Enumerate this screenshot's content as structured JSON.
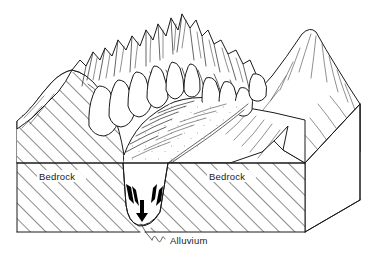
{
  "figure": {
    "type": "geological-block-diagram",
    "background_color": "#ffffff",
    "line_color": "#1a1a1a"
  },
  "labels": {
    "bedrock_left": "Bedrock",
    "bedrock_right": "Bedrock",
    "alluvium": "Alluvium"
  },
  "legend_patterns": {
    "bedrock_pattern": "diagonal-hatch",
    "alluvium_pattern": "horizontal-dash-stipple",
    "talus_pattern": "stipple-dots"
  },
  "features": [
    {
      "name": "arete-peaks",
      "label": "",
      "description": "serrated ridge crest with horn peaks"
    },
    {
      "name": "talus-cones",
      "label": "",
      "description": "stippled debris cones below cliffs"
    },
    {
      "name": "u-shaped-valley",
      "label": "",
      "description": "glacially carved valley cross-section"
    },
    {
      "name": "alluvial-fill",
      "label": "",
      "description": "valley fill sediment wedge"
    },
    {
      "name": "right-mountain",
      "label": "",
      "description": "mountain flank on right side"
    }
  ],
  "annotations": {
    "arrow_left": "down-slope indicator on left valley wall",
    "arrow_right": "down-slope indicator on right valley wall",
    "arrow_center": "downward indicator in alluvium",
    "leader": "wavy leader line to alluvium label"
  }
}
